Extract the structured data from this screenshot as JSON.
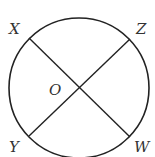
{
  "diagram": {
    "type": "circle-with-intersecting-chords",
    "center": {
      "label": "O",
      "x": 79,
      "y": 88
    },
    "radius": 70,
    "points": [
      {
        "label": "X",
        "x": 29,
        "y": 38
      },
      {
        "label": "Z",
        "x": 130,
        "y": 39
      },
      {
        "label": "Y",
        "x": 29,
        "y": 136
      },
      {
        "label": "W",
        "x": 130,
        "y": 137
      }
    ],
    "segments": [
      [
        "X",
        "W"
      ],
      [
        "Z",
        "Y"
      ]
    ],
    "stroke_color": "#222222"
  }
}
